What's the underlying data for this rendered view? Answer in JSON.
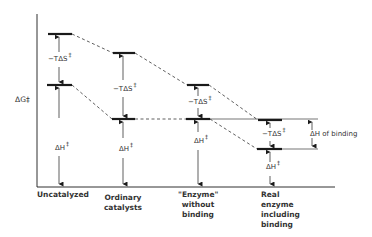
{
  "diagram": {
    "y_axis_label": "ΔG‡",
    "colors": {
      "line": "#1a1a1a",
      "text": "#333333",
      "background": "#ffffff"
    },
    "columns": [
      {
        "label": "Uncatalyzed",
        "lines": [
          "Uncatalyzed"
        ],
        "top_label": "−TΔS",
        "bottom_label": "ΔH",
        "sup": "‡"
      },
      {
        "label": "Ordinary catalysts",
        "lines": [
          "Ordinary",
          "catalysts"
        ],
        "top_label": "−TΔS",
        "bottom_label": "ΔH",
        "sup": "‡"
      },
      {
        "label": "\"Enzyme\" without binding",
        "lines": [
          "\"Enzyme\"",
          "without",
          "binding"
        ],
        "top_label": "−TΔS",
        "bottom_label": "ΔH",
        "sup": "‡"
      },
      {
        "label": "Real enzyme including binding",
        "lines": [
          "Real",
          "enzyme",
          "including",
          "binding"
        ],
        "top_label": "−TΔS",
        "bottom_label": "ΔH",
        "sup": "‡"
      }
    ],
    "binding_label": "ΔH of binding"
  }
}
